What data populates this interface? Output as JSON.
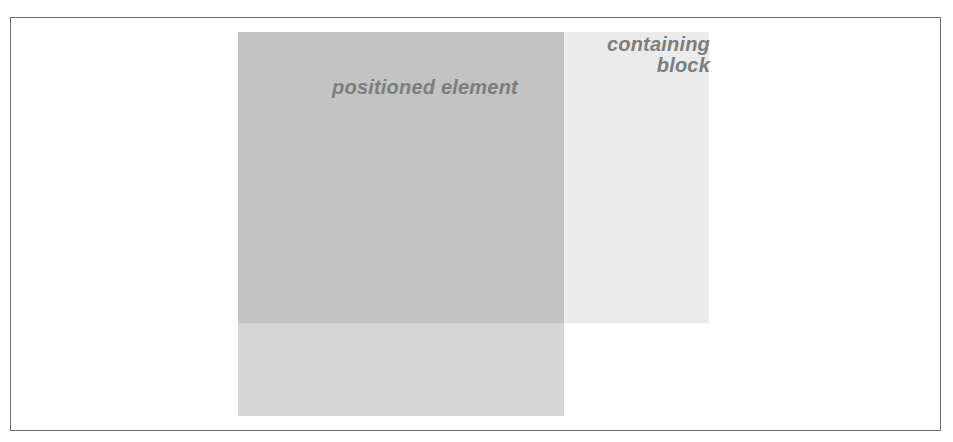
{
  "diagram": {
    "type": "css-positioning-illustration",
    "labels": {
      "positioned_element": "positioned element",
      "containing_block_line1": "containing",
      "containing_block_line2": "block"
    },
    "colors": {
      "frame_border": "#6e6e6e",
      "background": "#ffffff",
      "containing_block_fill": "#ebebeb",
      "positioned_element_fill": "#d5d5d5",
      "overlap_fill": "#c3c3c3",
      "label_text": "#7d7d7d"
    }
  }
}
